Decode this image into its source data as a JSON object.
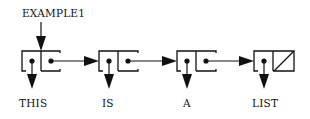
{
  "diagram": {
    "type": "linked-list-cons-cells",
    "head_label": "EXAMPLE1",
    "cells": [
      {
        "car": "THIS",
        "cdr": "next"
      },
      {
        "car": "IS",
        "cdr": "next"
      },
      {
        "car": "A",
        "cdr": "next"
      },
      {
        "car": "LIST",
        "cdr": "nil"
      }
    ],
    "colors": {
      "stroke": "#111111",
      "background": "#ffffff"
    }
  }
}
